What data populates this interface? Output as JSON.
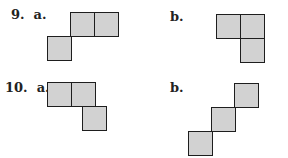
{
  "problems": [
    {
      "number": "9.",
      "parts": [
        {
          "label": "a.",
          "squares": [
            [
              70,
              12
            ],
            [
              94,
              12
            ],
            [
              47,
              36
            ]
          ]
        },
        {
          "label": "b.",
          "squares": [
            [
              216,
              14
            ],
            [
              240,
              14
            ],
            [
              240,
              38
            ]
          ]
        }
      ]
    },
    {
      "number": "10.",
      "parts": [
        {
          "label": "a.",
          "squares": [
            [
              47,
              82
            ],
            [
              71,
              82
            ],
            [
              82,
              106
            ]
          ]
        },
        {
          "label": "b.",
          "squares": [
            [
              234,
              83
            ],
            [
              211,
              107
            ],
            [
              188,
              131
            ]
          ]
        }
      ]
    }
  ],
  "labels": {
    "p9a": "9.  a.",
    "p9b": "b.",
    "p10a": "10.  a.",
    "p10b": "b."
  },
  "colors": {
    "fill": "#d2d2d2",
    "stroke": "#1e1e1e"
  },
  "square_size": 24
}
